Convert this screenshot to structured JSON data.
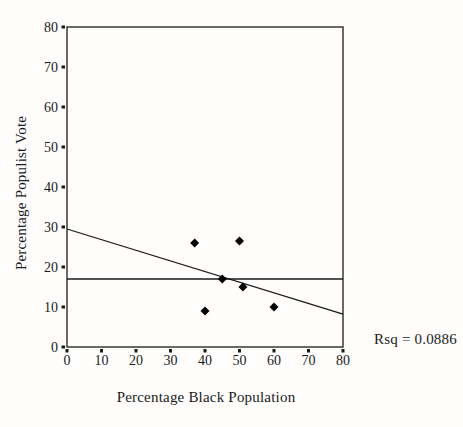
{
  "chart_data": {
    "type": "scatter",
    "title": "",
    "xlabel": "Percentage Black Population",
    "ylabel": "Percentage Populist Vote",
    "xlim": [
      0,
      80
    ],
    "ylim": [
      0,
      80
    ],
    "xticks": [
      0,
      10,
      20,
      30,
      40,
      50,
      60,
      70,
      80
    ],
    "yticks": [
      0,
      10,
      20,
      30,
      40,
      50,
      60,
      70,
      80
    ],
    "grid": false,
    "legend": false,
    "marker": "filled-diamond",
    "points": [
      {
        "x": 37,
        "y": 26
      },
      {
        "x": 50,
        "y": 26.5
      },
      {
        "x": 45,
        "y": 17
      },
      {
        "x": 51,
        "y": 15
      },
      {
        "x": 60,
        "y": 10
      },
      {
        "x": 40,
        "y": 9
      }
    ],
    "regression_line": {
      "x1": 0,
      "y1": 29.5,
      "x2": 80,
      "y2": 8.2
    },
    "mean_line_y": 17,
    "annotation": "Rsq = 0.0886",
    "colors": {
      "marker": "#000000",
      "line": "#1a1a1a",
      "axis": "#1a1a1a",
      "text": "#1a1a1a",
      "background": "#fffefd"
    }
  }
}
